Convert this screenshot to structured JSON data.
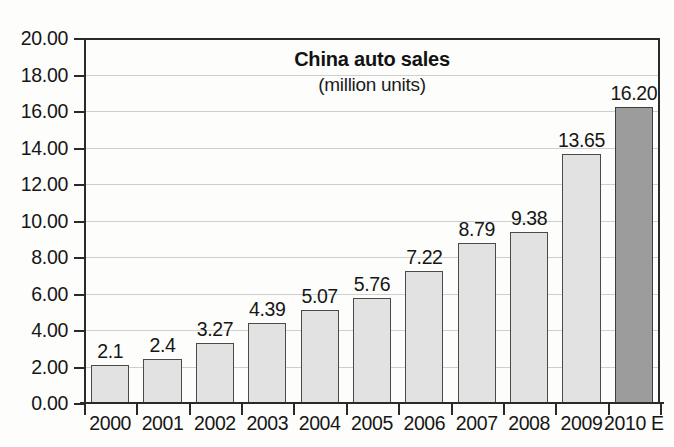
{
  "chart_data": {
    "type": "bar",
    "title": "China auto sales",
    "subtitle": "(million units)",
    "xlabel": "",
    "ylabel": "",
    "ylim": [
      0,
      20
    ],
    "ytick_step": 2,
    "grid": true,
    "legend": "none",
    "categories": [
      "2000",
      "2001",
      "2002",
      "2003",
      "2004",
      "2005",
      "2006",
      "2007",
      "2008",
      "2009",
      "2010 E"
    ],
    "values": [
      2.1,
      2.4,
      3.27,
      4.39,
      5.07,
      5.76,
      7.22,
      8.79,
      9.38,
      13.65,
      16.2
    ],
    "value_labels": [
      "2.1",
      "2.4",
      "3.27",
      "4.39",
      "5.07",
      "5.76",
      "7.22",
      "8.79",
      "9.38",
      "13.65",
      "16.20"
    ],
    "ytick_labels": [
      "0.00",
      "2.00",
      "4.00",
      "6.00",
      "8.00",
      "10.00",
      "12.00",
      "14.00",
      "16.00",
      "18.00",
      "20.00"
    ],
    "ytick_values": [
      0,
      2,
      4,
      6,
      8,
      10,
      12,
      14,
      16,
      18,
      20
    ],
    "series": [
      {
        "name": "China auto sales",
        "values": [
          2.1,
          2.4,
          3.27,
          4.39,
          5.07,
          5.76,
          7.22,
          8.79,
          9.38,
          13.65,
          16.2
        ]
      }
    ],
    "bar_styles": [
      "light",
      "light",
      "light",
      "light",
      "light",
      "light",
      "light",
      "light",
      "light",
      "light",
      "dark"
    ],
    "colors": {
      "bar_light": "#e2e2e2",
      "bar_dark": "#9c9c9c",
      "bar_border": "#4a4a4a",
      "axis": "#2a2a2a",
      "gridline": "#cfcfcf",
      "text": "#161616",
      "background": "#fdfdfc"
    }
  }
}
